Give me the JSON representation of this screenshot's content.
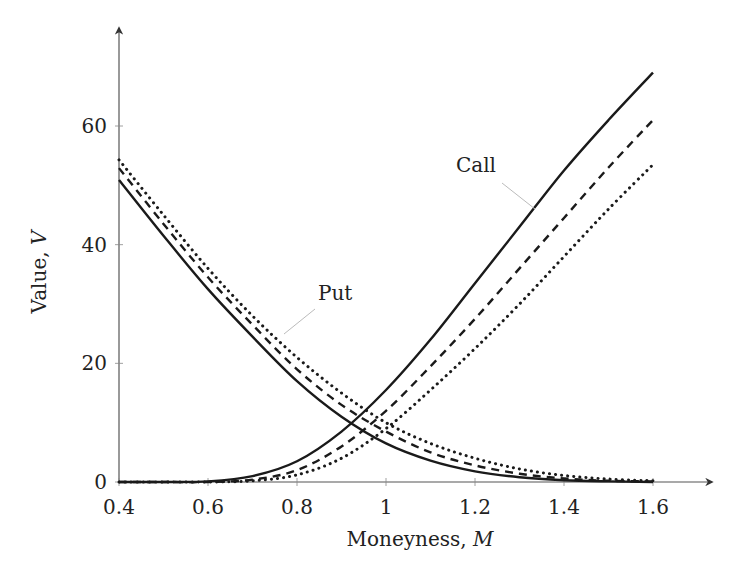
{
  "chart_data": {
    "type": "line",
    "title": "",
    "xlabel": "Moneyness, M",
    "ylabel": "Value, V",
    "xlim": [
      0.4,
      1.7
    ],
    "ylim": [
      0,
      75
    ],
    "grid": false,
    "legend": null,
    "x_ticks": [
      0.4,
      0.6,
      0.8,
      1,
      1.2,
      1.4,
      1.6
    ],
    "x_tick_labels": [
      "0.4",
      "0.6",
      "0.8",
      "1",
      "1.2",
      "1.4",
      "1.6"
    ],
    "y_ticks": [
      0,
      20,
      40,
      60
    ],
    "y_tick_labels": [
      "0",
      "20",
      "40",
      "60"
    ],
    "x": [
      0.4,
      0.5,
      0.6,
      0.7,
      0.8,
      0.9,
      1.0,
      1.1,
      1.2,
      1.3,
      1.4,
      1.5,
      1.6
    ],
    "series": [
      {
        "name": "Call (solid)",
        "style": "solid",
        "values": [
          0,
          0,
          0.1,
          1,
          3.5,
          8.5,
          15.5,
          24,
          33.5,
          43,
          52.5,
          61,
          69
        ]
      },
      {
        "name": "Call (dashed)",
        "style": "dashed",
        "values": [
          0,
          0,
          0,
          0.4,
          2,
          6,
          12,
          19.5,
          27.5,
          36,
          44.5,
          53,
          61
        ]
      },
      {
        "name": "Call (dotted)",
        "style": "dotted",
        "values": [
          0,
          0,
          0,
          0.2,
          1.2,
          4,
          9,
          15.5,
          22.5,
          30,
          38,
          46,
          53.5
        ]
      },
      {
        "name": "Put (solid)",
        "style": "solid",
        "values": [
          50.9,
          41.5,
          32.5,
          24.5,
          17,
          11,
          6.5,
          3.6,
          1.8,
          0.8,
          0.3,
          0.1,
          0
        ]
      },
      {
        "name": "Put (dashed)",
        "style": "dashed",
        "values": [
          52.9,
          43.5,
          34.5,
          26.5,
          19,
          13,
          8.5,
          5,
          2.8,
          1.4,
          0.6,
          0.2,
          0.1
        ]
      },
      {
        "name": "Put (dotted)",
        "style": "dotted",
        "values": [
          54.3,
          45,
          36,
          28,
          21,
          15,
          10,
          6.5,
          4,
          2.2,
          1.1,
          0.5,
          0.2
        ]
      }
    ],
    "annotations": [
      {
        "text": "Call",
        "x": 1.02,
        "y": 54
      },
      {
        "text": "Put",
        "x": 0.88,
        "y": 32
      }
    ]
  },
  "labels": {
    "xlabel_text": "Moneyness, ",
    "xlabel_var": "M",
    "ylabel_text": "Value, ",
    "ylabel_var": "V",
    "call": "Call",
    "put": "Put"
  },
  "colors": {
    "line": "#1a1a1a",
    "axis": "#555555",
    "leader": "#bbbbbb"
  }
}
